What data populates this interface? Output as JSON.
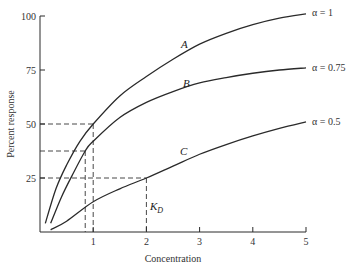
{
  "chart_data": {
    "type": "line",
    "title": "",
    "xlabel": "Concentration",
    "ylabel": "Percent response",
    "xlim": [
      0,
      5
    ],
    "ylim": [
      0,
      100
    ],
    "x_ticks": [
      1,
      2,
      3,
      4,
      5
    ],
    "x_tick_labels": [
      "1",
      "2",
      "3",
      "4",
      "5"
    ],
    "y_ticks": [
      25,
      50,
      75,
      100
    ],
    "y_tick_labels": [
      "25",
      "50",
      "75",
      "100"
    ],
    "grid": false,
    "series": [
      {
        "name": "A",
        "legend": "α = 1",
        "x": [
          0.1,
          0.3,
          0.5,
          0.75,
          1,
          1.5,
          2,
          2.5,
          3,
          3.5,
          4,
          4.5,
          5
        ],
        "y": [
          4,
          20,
          31,
          42,
          50,
          63,
          72,
          80,
          87,
          92,
          96,
          99,
          101
        ]
      },
      {
        "name": "B",
        "legend": "α = 0.75",
        "x": [
          0.2,
          0.4,
          0.6,
          0.85,
          1,
          1.5,
          2,
          2.5,
          3,
          3.5,
          4,
          4.5,
          5
        ],
        "y": [
          4,
          16,
          26,
          37.5,
          42,
          53,
          60,
          65,
          69,
          71.5,
          73.5,
          75,
          76
        ]
      },
      {
        "name": "C",
        "legend": "α = 0.5",
        "x": [
          0.2,
          0.5,
          1,
          1.5,
          2,
          2.5,
          3,
          3.5,
          4,
          4.5,
          5
        ],
        "y": [
          1,
          5,
          14,
          20,
          25,
          30.5,
          36,
          40.5,
          44.5,
          48,
          51
        ]
      }
    ],
    "annotations": {
      "curve_labels": [
        "A",
        "B",
        "C"
      ],
      "kd_label": "K",
      "kd_subscript": "D",
      "reference_lines": [
        {
          "series": "A",
          "x": 1,
          "y": 50
        },
        {
          "series": "B",
          "x": 0.85,
          "y": 37.5
        },
        {
          "series": "C",
          "x": 2,
          "y": 25
        }
      ]
    }
  }
}
